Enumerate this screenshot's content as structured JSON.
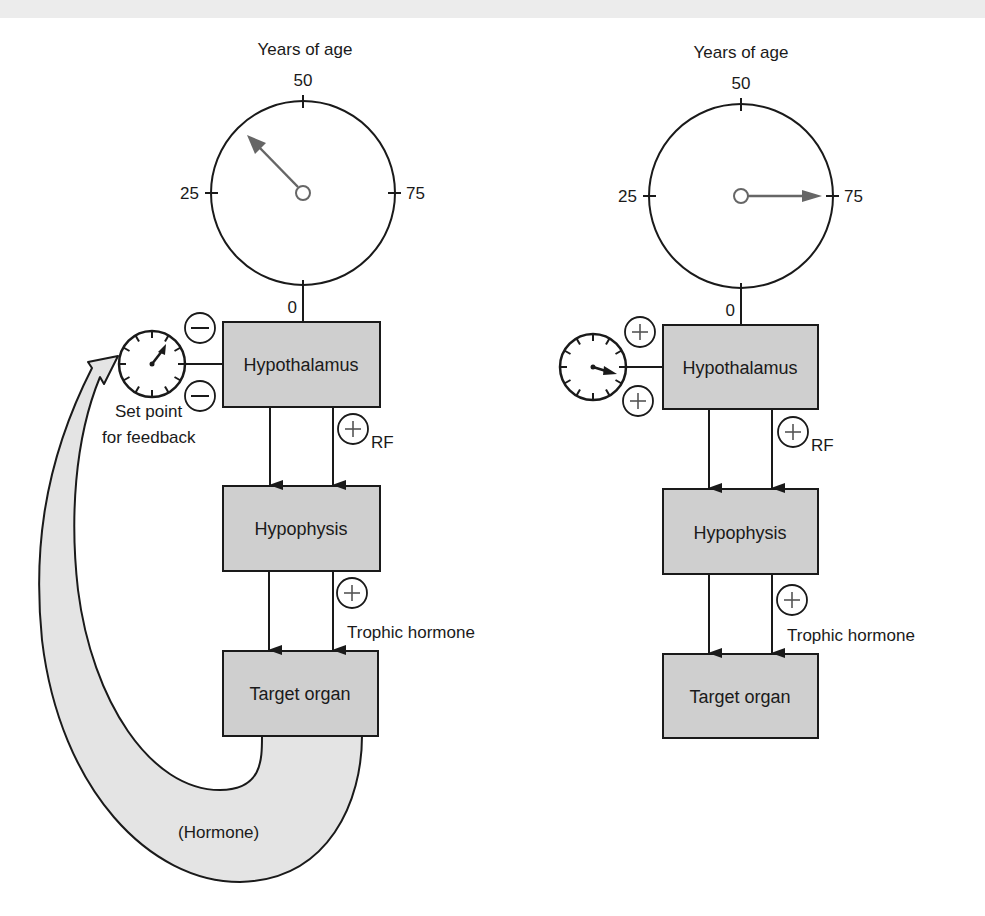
{
  "colors": {
    "box_fill": "#cfcfcf",
    "hormone_band_fill": "#e4e4e4",
    "ink": "#1a1a1a",
    "clock_hand": "#666666",
    "top_bleed": "#ececec"
  },
  "diagrams": [
    {
      "id": "young",
      "age_dial": {
        "title": "Years of age",
        "ticks": {
          "top": "50",
          "left": "25",
          "right": "75",
          "bottom": "0"
        },
        "hand_direction": "between 25 and 50 (about 37 years)"
      },
      "setpoint_dial": {
        "hand_direction": "about 1 o'clock"
      },
      "setpoint_label": [
        "Set point",
        "for feedback"
      ],
      "feedback_signs": [
        "−",
        "−"
      ],
      "boxes": {
        "hypothalamus": "Hypothalamus",
        "hypophysis": "Hypophysis",
        "target": "Target organ"
      },
      "rf_sign": "+",
      "rf_label": "RF",
      "trophic_sign": "+",
      "trophic_label": "Trophic hormone",
      "hormone_label": "(Hormone)"
    },
    {
      "id": "old",
      "age_dial": {
        "title": "Years of age",
        "ticks": {
          "top": "50",
          "left": "25",
          "right": "75",
          "bottom": "0"
        },
        "hand_direction": "pointing to 75"
      },
      "setpoint_dial": {
        "hand_direction": "about 3-4 o'clock"
      },
      "feedback_signs": [
        "+",
        "+"
      ],
      "boxes": {
        "hypothalamus": "Hypothalamus",
        "hypophysis": "Hypophysis",
        "target": "Target organ"
      },
      "rf_sign": "+",
      "rf_label": "RF",
      "trophic_sign": "+",
      "trophic_label": "Trophic hormone"
    }
  ]
}
